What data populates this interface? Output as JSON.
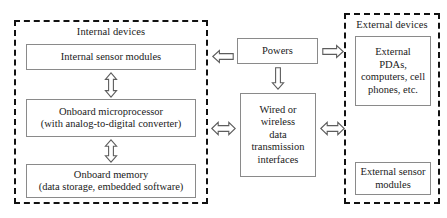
{
  "diagram": {
    "groups": [
      {
        "id": "internal",
        "label": "Internal devices"
      },
      {
        "id": "external",
        "label": "External devices"
      }
    ],
    "nodes": {
      "internal_sensor_modules": {
        "lines": [
          "Internal sensor modules"
        ]
      },
      "onboard_microprocessor": {
        "lines": [
          "Onboard microprocessor",
          "(with analog-to-digital converter)"
        ]
      },
      "onboard_memory": {
        "lines": [
          "Onboard memory",
          "(data storage, embedded software)"
        ]
      },
      "powers": {
        "lines": [
          "Powers"
        ]
      },
      "transmission_interfaces": {
        "lines": [
          "Wired or",
          "wireless",
          "data",
          "transmission",
          "interfaces"
        ]
      },
      "external_pdas": {
        "lines": [
          "External",
          "PDAs,",
          "computers, cell",
          "phones, etc."
        ]
      },
      "external_sensor_modules": {
        "lines": [
          "External sensor",
          "modules"
        ]
      }
    },
    "arrows": [
      {
        "id": "sensor-to-microprocessor",
        "icon": "double-headed-vertical-arrow-icon",
        "direction": "vertical-both"
      },
      {
        "id": "microprocessor-to-memory",
        "icon": "double-headed-vertical-arrow-icon",
        "direction": "vertical-both"
      },
      {
        "id": "powers-to-internal",
        "icon": "left-arrow-icon",
        "direction": "left"
      },
      {
        "id": "powers-to-transmission",
        "icon": "down-arrow-icon",
        "direction": "down"
      },
      {
        "id": "powers-to-external",
        "icon": "right-arrow-icon",
        "direction": "right"
      },
      {
        "id": "internal-to-transmission",
        "icon": "double-headed-horizontal-arrow-icon",
        "direction": "horizontal-both"
      },
      {
        "id": "transmission-to-external",
        "icon": "double-headed-horizontal-arrow-icon",
        "direction": "horizontal-both"
      }
    ],
    "colors": {
      "background": "#ffffff",
      "group_border": "#111111",
      "node_border": "#8a8a8a",
      "arrow_stroke": "#5d5d5d",
      "arrow_fill": "#ffffff",
      "text": "#1a1a1a"
    }
  }
}
